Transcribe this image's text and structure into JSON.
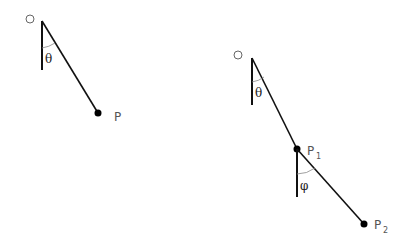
{
  "diagram": {
    "type": "pendulum-diagram",
    "simple_pendulum": {
      "pivot_label": "O",
      "angle_label": "θ",
      "bob_label": "P"
    },
    "double_pendulum": {
      "pivot_label": "O",
      "angle1_label": "θ",
      "bob1_label": "P",
      "bob1_sub": "1",
      "angle2_label": "φ",
      "bob2_label": "P",
      "bob2_sub": "2"
    },
    "colors": {
      "line": "#111111",
      "arc": "#777777",
      "label": "#555555"
    }
  }
}
